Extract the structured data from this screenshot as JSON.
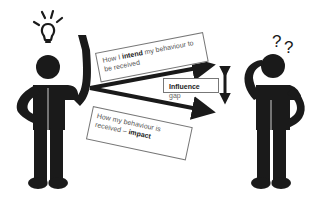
{
  "diagram": {
    "left_figure": {
      "role": "sender",
      "icon": "lightbulb-icon",
      "pose": "hand-raised"
    },
    "right_figure": {
      "role": "receiver",
      "icon": "question-marks-icon",
      "symbol": "??",
      "pose": "scratching-head"
    },
    "labels": {
      "intend": {
        "pre": "How I ",
        "bold": "intend",
        "post": " my behaviour to be received"
      },
      "impact": {
        "pre": "How my behaviour is received – ",
        "bold": "impact",
        "post": ""
      },
      "gap": {
        "bold": "Influence",
        "post": " gap"
      }
    },
    "colors": {
      "figure": "#1a1a1a",
      "arrow": "#1a1a1a",
      "box_border": "#777777",
      "text": "#555555"
    }
  }
}
